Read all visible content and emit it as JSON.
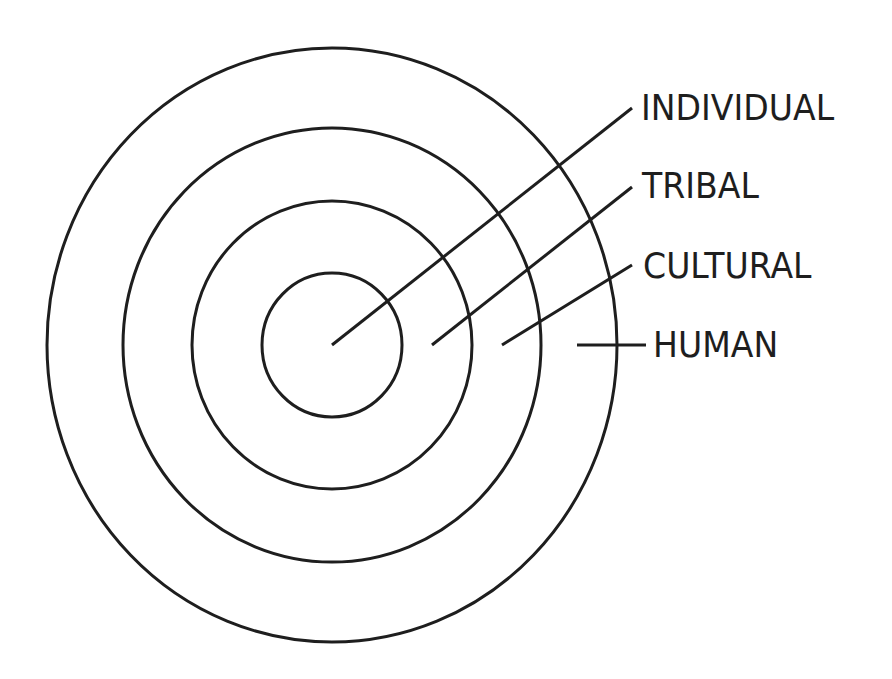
{
  "diagram": {
    "title": "",
    "colors": {
      "stroke": "#1e1e1e",
      "background": "#ffffff",
      "text": "#1e1e1e"
    },
    "center": {
      "x": 332,
      "y": 345
    },
    "rings": [
      {
        "name": "individual",
        "rx": 70,
        "ry": 72
      },
      {
        "name": "tribal",
        "rx": 140,
        "ry": 144
      },
      {
        "name": "cultural",
        "rx": 209,
        "ry": 217
      },
      {
        "name": "human",
        "rx": 285,
        "ry": 297
      }
    ],
    "labels": [
      {
        "id": "individual",
        "text": "INDIVIDUAL",
        "line": {
          "x1": 332,
          "y1": 345,
          "x2": 632,
          "y2": 108
        },
        "text_x": 641,
        "text_y": 90
      },
      {
        "id": "tribal",
        "text": "TRIBAL",
        "line": {
          "x1": 432,
          "y1": 345,
          "x2": 632,
          "y2": 187
        },
        "text_x": 642,
        "text_y": 168
      },
      {
        "id": "cultural",
        "text": "CULTURAL",
        "line": {
          "x1": 502,
          "y1": 345,
          "x2": 632,
          "y2": 265
        },
        "text_x": 643,
        "text_y": 248
      },
      {
        "id": "human",
        "text": "HUMAN",
        "line": {
          "x1": 577,
          "y1": 345,
          "x2": 646,
          "y2": 345
        },
        "text_x": 653,
        "text_y": 327
      }
    ]
  }
}
